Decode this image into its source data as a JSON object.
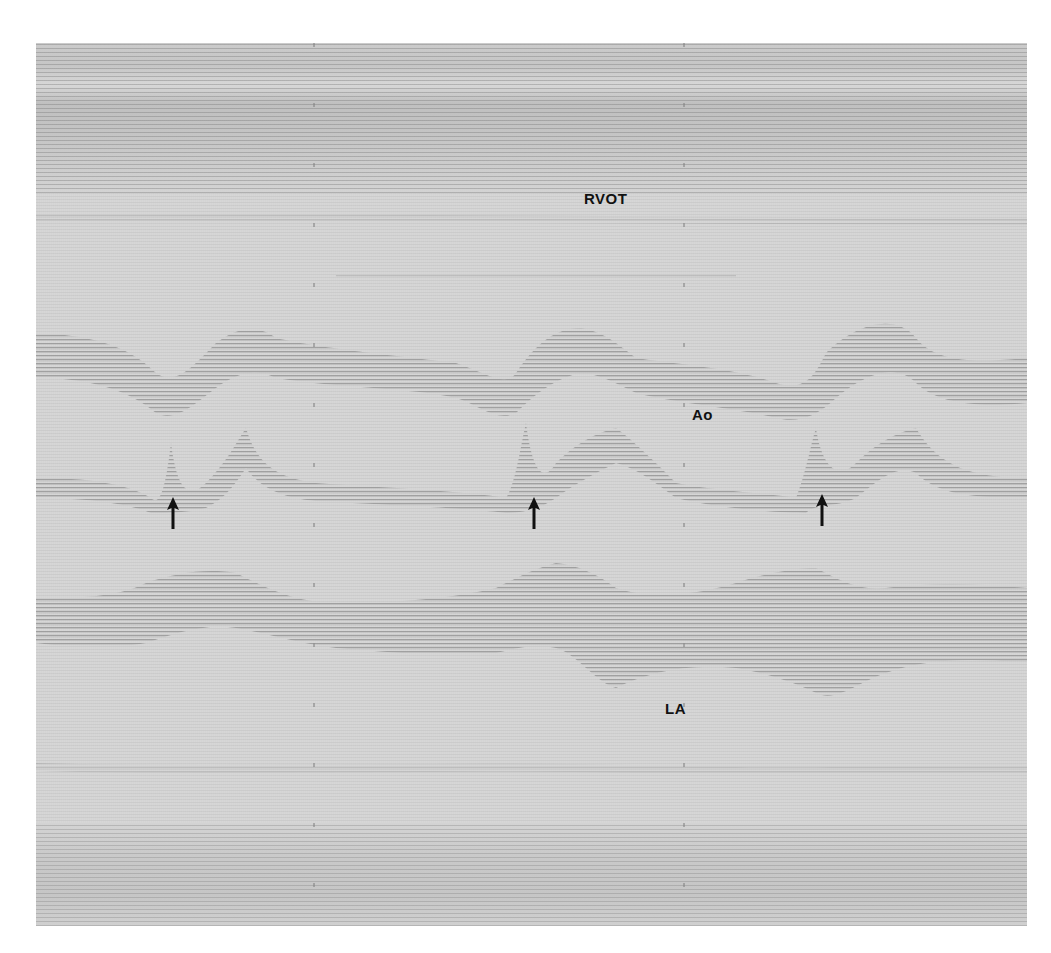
{
  "figure": {
    "type": "M-mode echocardiogram",
    "labels": {
      "rvot": "RVOT",
      "ao": "Ao",
      "la": "LA"
    },
    "arrows": [
      {
        "name": "arrow-1",
        "direction": "up"
      },
      {
        "name": "arrow-2",
        "direction": "up"
      },
      {
        "name": "arrow-3",
        "direction": "up"
      }
    ],
    "colors": {
      "background": "#d4d4d4",
      "echo_lines": "#9a9a9a",
      "text": "#111111",
      "arrow": "#111111"
    }
  }
}
